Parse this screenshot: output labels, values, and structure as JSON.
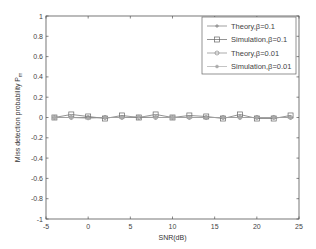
{
  "chart_data": {
    "type": "line",
    "title": "",
    "xlabel": "SNR(dB)",
    "ylabel": "Miss detection probability P_m",
    "xlim": [
      -5,
      25
    ],
    "ylim": [
      -1,
      1
    ],
    "xticks": [
      -5,
      0,
      5,
      10,
      15,
      20,
      25
    ],
    "yticks": [
      1,
      0.8,
      0.6,
      0.4,
      0.2,
      0,
      -0.2,
      -0.4,
      -0.6,
      -0.8,
      -1
    ],
    "grid": false,
    "legend_position": "upper right",
    "x": [
      -4,
      -2,
      0,
      2,
      4,
      6,
      8,
      10,
      12,
      14,
      16,
      18,
      20,
      22,
      24
    ],
    "series": [
      {
        "name": "Theory,β=0.1",
        "marker": "plus",
        "color": "#777777",
        "values": [
          0,
          0,
          0,
          0,
          0,
          0,
          0,
          0,
          0,
          0,
          0,
          0,
          0,
          0,
          0
        ]
      },
      {
        "name": "Simulation,β=0.1",
        "marker": "square",
        "color": "#666666",
        "values": [
          0.0,
          0.03,
          0.01,
          -0.01,
          0.02,
          0.0,
          0.03,
          0.0,
          0.02,
          0.01,
          -0.01,
          0.03,
          -0.01,
          -0.01,
          0.02
        ]
      },
      {
        "name": "Theory,β=0.01",
        "marker": "circle",
        "color": "#888888",
        "values": [
          0,
          0,
          0,
          0,
          0,
          0,
          0,
          0,
          0,
          0,
          0,
          0,
          0,
          0,
          0
        ]
      },
      {
        "name": "Simulation,β=0.01",
        "marker": "dot",
        "color": "#aaaaaa",
        "values": [
          0.0,
          0.0,
          -0.01,
          0.0,
          0.0,
          0.01,
          0.0,
          0.0,
          0.0,
          0.0,
          0.0,
          0.0,
          0.0,
          0.0,
          0.0
        ]
      }
    ]
  },
  "axes": {
    "xlabel": "SNR(dB)",
    "ylabel_main": "Miss detection probability P",
    "ylabel_sub": "m"
  },
  "legend": {
    "items": [
      "Theory,β=0.1",
      "Simulation,β=0.1",
      "Theory,β=0.01",
      "Simulation,β=0.01"
    ]
  }
}
